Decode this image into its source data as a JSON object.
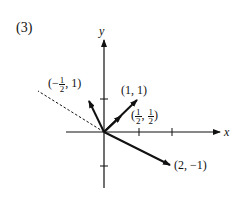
{
  "figure": {
    "label": "(3)",
    "axes": {
      "x_label": "x",
      "y_label": "y"
    },
    "vectors": [
      {
        "name": "v-1-1",
        "label": "(1, 1)",
        "x": 1,
        "y": 1
      },
      {
        "name": "v-half-half",
        "label": "(1/2, 1/2)",
        "x": 0.5,
        "y": 0.5
      },
      {
        "name": "v-neg-half-1",
        "label": "(-1/2, 1)",
        "x": -0.5,
        "y": 1
      },
      {
        "name": "v-2-neg1",
        "label": "(2, -1)",
        "x": 2,
        "y": -1
      }
    ],
    "labels": {
      "v11": "(1, 1)",
      "vhalf_open": "(",
      "vhalf_num1": "1",
      "vhalf_den1": "2",
      "vhalf_sep": ",",
      "vhalf_num2": "1",
      "vhalf_den2": "2",
      "vhalf_close": ")",
      "vneg_open": "(−",
      "vneg_num": "1",
      "vneg_den": "2",
      "vneg_rest": ", 1)",
      "v2m1": "(2, −1)"
    }
  }
}
